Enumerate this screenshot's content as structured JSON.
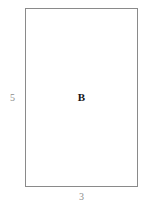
{
  "figure": {
    "type": "geometry-diagram",
    "background_color": "#ffffff",
    "width_px": 145,
    "height_px": 206,
    "shape": {
      "kind": "rectangle",
      "name_label": "B",
      "stroke_color": "#8a8a8a",
      "stroke_width_px": 1,
      "fill_color": "#ffffff",
      "label_color": "#141414"
    },
    "dimensions": {
      "height_label": "5",
      "width_label": "3",
      "label_color": "#8d8d8d"
    }
  },
  "chart_data": {
    "type": "diagram",
    "title": "",
    "shapes": [
      {
        "id": "B",
        "type": "rectangle",
        "label": "B",
        "width": 3,
        "height": 5,
        "area": 15,
        "perimeter": 16,
        "width_label": "3",
        "height_label": "5"
      }
    ],
    "annotations": [
      {
        "text": "B",
        "role": "shape-name",
        "position": "center"
      },
      {
        "text": "5",
        "role": "height-dimension",
        "position": "left"
      },
      {
        "text": "3",
        "role": "width-dimension",
        "position": "bottom"
      }
    ]
  }
}
